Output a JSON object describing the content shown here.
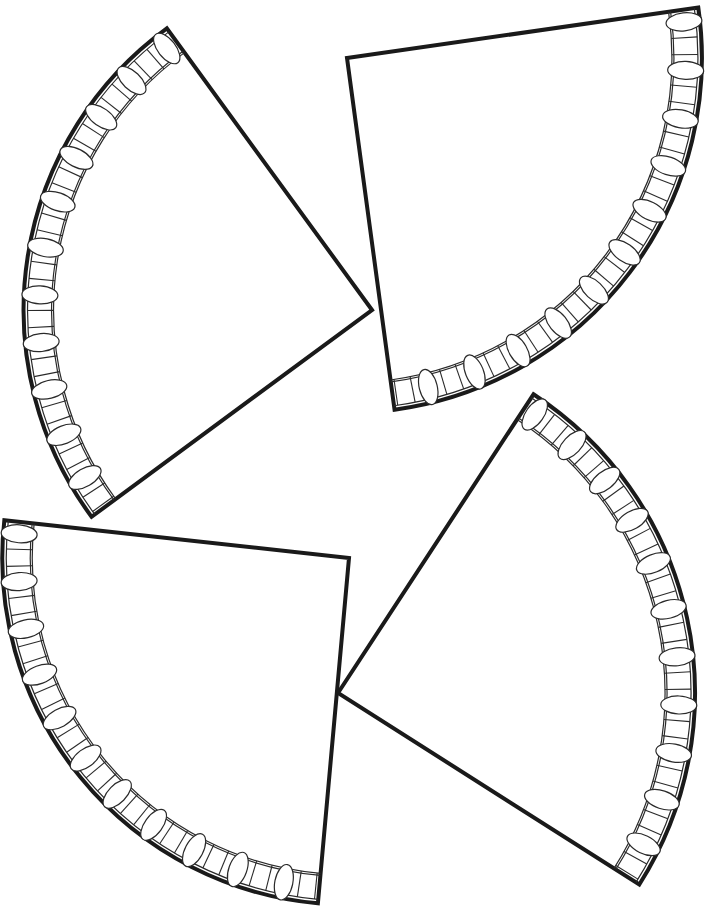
{
  "page": {
    "background": "#ffffff",
    "line_color": "#1a1a1a"
  },
  "wedges": [
    {
      "name": "wedge-top-left",
      "apex": [
        372,
        310
      ],
      "tipA": [
        168,
        30
      ],
      "tipB": [
        90,
        518
      ],
      "rim_units": 11
    },
    {
      "name": "wedge-top-right",
      "apex": [
        347,
        58
      ],
      "tipA": [
        695,
        8
      ],
      "tipB": [
        395,
        413
      ],
      "rim_units": 11
    },
    {
      "name": "wedge-bottom-left",
      "apex": [
        349,
        558
      ],
      "tipA": [
        3,
        520
      ],
      "tipB": [
        318,
        902
      ],
      "rim_units": 11
    },
    {
      "name": "wedge-bottom-right",
      "apex": [
        338,
        693
      ],
      "tipA": [
        535,
        392
      ],
      "tipB": [
        637,
        883
      ],
      "rim_units": 11
    }
  ],
  "rim": {
    "band_width": 30,
    "inner_line_offset": 4
  }
}
